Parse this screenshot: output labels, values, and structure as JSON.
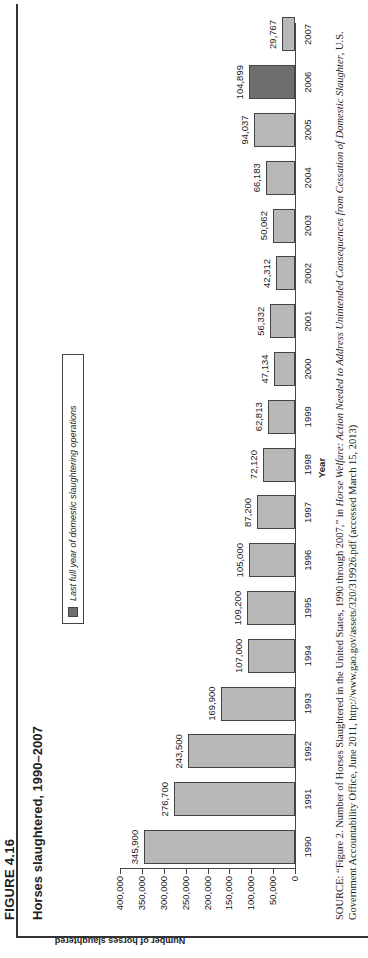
{
  "figure_label": "FIGURE 4.16",
  "title": "Horses slaughtered, 1990–2007",
  "legend": {
    "label": "Last full year of domestic slaughtering operations",
    "color": "#6e6e6e"
  },
  "source": {
    "prefix": "SOURCE:",
    "part1": " “Figure 2. Number of Horses Slaughtered in the United States, 1990 through 2007,” in ",
    "italic": "Horse Welfare: Action Needed to Address Unintended Consequences from Cessation of Domestic Slaughter",
    "part2": ", U.S. Government Accountability Office, June 2011, http://www.gao.gov/assets/320/319926.pdf (accessed March 15, 2013)"
  },
  "chart_data": {
    "type": "bar",
    "title": "Horses slaughtered, 1990–2007",
    "xlabel": "Year",
    "ylabel": "Number of horses slaughtered",
    "ylim": [
      0,
      400000
    ],
    "yticks": [
      "0",
      "50,000",
      "100,000",
      "150,000",
      "200,000",
      "250,000",
      "300,000",
      "350,000",
      "400,000"
    ],
    "categories": [
      "1990",
      "1991",
      "1992",
      "1993",
      "1994",
      "1995",
      "1996",
      "1997",
      "1998",
      "1999",
      "2000",
      "2001",
      "2002",
      "2003",
      "2004",
      "2005",
      "2006",
      "2007"
    ],
    "values": [
      345900,
      276700,
      243500,
      169900,
      107000,
      109200,
      105000,
      87200,
      72120,
      62813,
      47134,
      56332,
      42312,
      50062,
      66183,
      94037,
      104899,
      29767
    ],
    "value_labels": [
      "345,900",
      "276,700",
      "243,500",
      "169,900",
      "107,000",
      "109,200",
      "105,000",
      "87,200",
      "72,120",
      "62,813",
      "47,134",
      "56,332",
      "42,312",
      "50,062",
      "66,183",
      "94,037",
      "104,899",
      "29,767"
    ],
    "highlight_index": 16,
    "bar_color": "#b8b8b8",
    "highlight_color": "#6e6e6e",
    "legend_position": "top-center",
    "grid": false
  }
}
